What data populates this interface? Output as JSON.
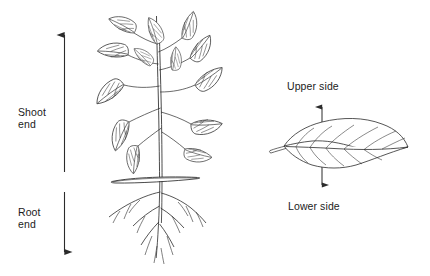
{
  "figure": {
    "background_color": "#ffffff",
    "ink_color": "#2b2b2b",
    "text_color": "#1b1b1b"
  },
  "labels": {
    "shoot_end": "Shoot\nend",
    "root_end": "Root\nend",
    "upper_side": "Upper side",
    "lower_side": "Lower side"
  },
  "panels": {
    "plant": {
      "name": "whole-plant-drawing",
      "parts": [
        "shoot-system",
        "leaves",
        "stem",
        "soil-line",
        "root-system"
      ]
    },
    "leaf": {
      "name": "single-leaf-drawing",
      "parts": [
        "leaf-blade",
        "midrib",
        "lateral-veins",
        "petiole"
      ]
    }
  },
  "arrows": {
    "shoot_axis": {
      "name": "shoot-end-arrow",
      "direction": "up",
      "from_y": 172,
      "to_y": 32
    },
    "root_axis": {
      "name": "root-end-arrow",
      "direction": "down",
      "from_y": 192,
      "to_y": 255
    },
    "upper_side": {
      "name": "upper-side-arrow",
      "direction": "up",
      "from_y": 140,
      "to_y": 104
    },
    "lower_side": {
      "name": "lower-side-arrow",
      "direction": "down",
      "from_y": 155,
      "to_y": 188
    }
  }
}
